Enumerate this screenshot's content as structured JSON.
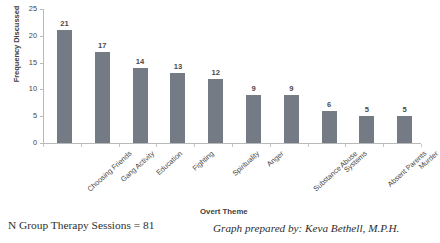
{
  "chart_data": {
    "type": "bar",
    "title": "",
    "categories": [
      "Choosing Friends",
      "Gang Activity",
      "Education",
      "Fighting",
      "Spirituality",
      "Anger",
      "Substance Abuse",
      "Systems",
      "Absent Parents",
      "Murder"
    ],
    "values": [
      21,
      17,
      14,
      13,
      12,
      9,
      9,
      6,
      5,
      5
    ],
    "xlabel": "Overt Theme",
    "ylabel": "Frequency Discussed",
    "ylim": [
      0,
      25
    ],
    "yticks": [
      0,
      5,
      10,
      15,
      20,
      25
    ],
    "ytick_labels": [
      "0",
      "5",
      "10",
      "15",
      "20",
      "25"
    ],
    "grid": false,
    "legend": "none",
    "bar_color": "#757b84",
    "data_labels": [
      "21",
      "17",
      "14",
      "13",
      "12",
      "9",
      "9",
      "6",
      "5",
      "5"
    ]
  },
  "footer": {
    "sample_note": "N Group Therapy Sessions = 81",
    "credit": "Graph prepared by: Keva Bethell, M.P.H."
  }
}
